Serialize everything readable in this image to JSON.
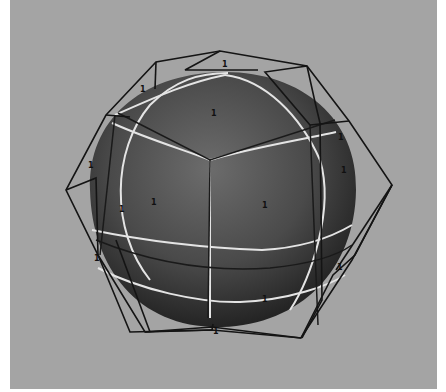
{
  "viewport": {
    "background": "#a4a4a4",
    "object": "subdivision-sphere",
    "cage": "control-cage",
    "colors": {
      "sphere_light": "#6a6a6a",
      "sphere_dark": "#262626",
      "isoparm": "#e6e6e6",
      "cage_line": "#141414",
      "label": "#101010"
    },
    "vertex_labels": [
      {
        "text": "1",
        "x": 222,
        "y": 67
      },
      {
        "text": "1",
        "x": 211,
        "y": 113
      },
      {
        "text": "1",
        "x": 142,
        "y": 88
      },
      {
        "text": "1",
        "x": 338,
        "y": 138
      },
      {
        "text": "1",
        "x": 151,
        "y": 202
      },
      {
        "text": "1",
        "x": 262,
        "y": 206
      },
      {
        "text": "1",
        "x": 92,
        "y": 166
      },
      {
        "text": "1",
        "x": 119,
        "y": 210
      },
      {
        "text": "1",
        "x": 341,
        "y": 170
      },
      {
        "text": "1",
        "x": 94,
        "y": 259
      },
      {
        "text": "1",
        "x": 337,
        "y": 268
      },
      {
        "text": "1",
        "x": 213,
        "y": 333
      },
      {
        "text": "1",
        "x": 262,
        "y": 299
      }
    ]
  }
}
